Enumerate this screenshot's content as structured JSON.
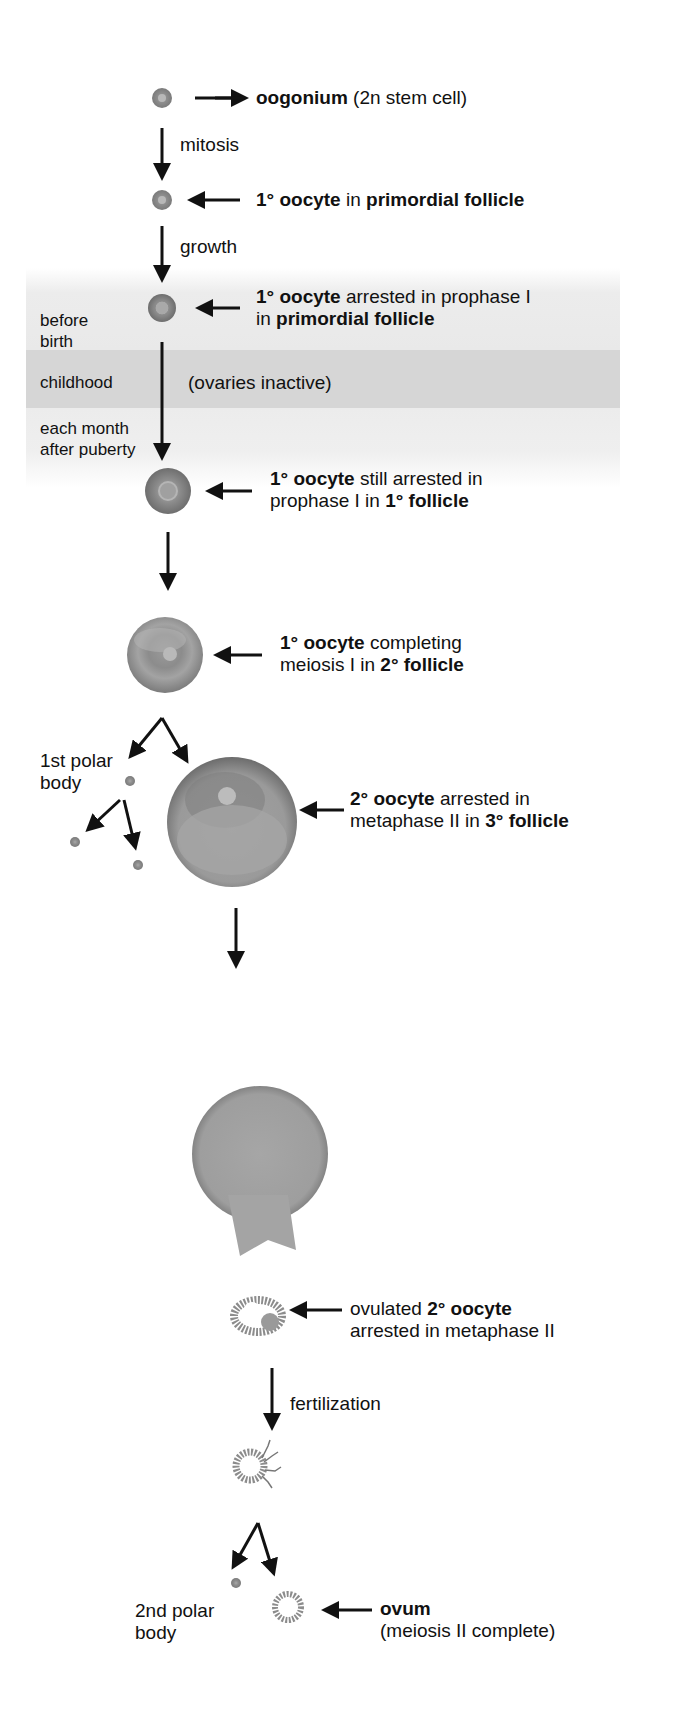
{
  "stages": [
    {
      "id": "oogonium",
      "lines": [
        [
          {
            "t": "oogonium",
            "b": true
          },
          {
            "t": " (2n stem cell)",
            "b": false
          }
        ]
      ]
    },
    {
      "id": "primary-oocyte-primordial",
      "lines": [
        [
          {
            "t": "1° oocyte",
            "b": true
          },
          {
            "t": " in ",
            "b": false
          },
          {
            "t": "primordial follicle",
            "b": true
          }
        ]
      ]
    },
    {
      "id": "primary-oocyte-arrested",
      "lines": [
        [
          {
            "t": "1° oocyte",
            "b": true
          },
          {
            "t": " arrested in prophase I",
            "b": false
          }
        ],
        [
          {
            "t": "in ",
            "b": false
          },
          {
            "t": "primordial follicle",
            "b": true
          }
        ]
      ]
    },
    {
      "id": "primary-oocyte-primary-follicle",
      "lines": [
        [
          {
            "t": "1° oocyte",
            "b": true
          },
          {
            "t": " still arrested in",
            "b": false
          }
        ],
        [
          {
            "t": "prophase I in ",
            "b": false
          },
          {
            "t": "1° follicle",
            "b": true
          }
        ]
      ]
    },
    {
      "id": "primary-oocyte-secondary-follicle",
      "lines": [
        [
          {
            "t": "1° oocyte",
            "b": true
          },
          {
            "t": " completing",
            "b": false
          }
        ],
        [
          {
            "t": "meiosis I in ",
            "b": false
          },
          {
            "t": "2° follicle",
            "b": true
          }
        ]
      ]
    },
    {
      "id": "secondary-oocyte-tertiary-follicle",
      "lines": [
        [
          {
            "t": "2° oocyte",
            "b": true
          },
          {
            "t": " arrested in",
            "b": false
          }
        ],
        [
          {
            "t": "metaphase II in ",
            "b": false
          },
          {
            "t": "3° follicle",
            "b": true
          }
        ]
      ]
    },
    {
      "id": "ovulated-secondary-oocyte",
      "lines": [
        [
          {
            "t": "ovulated ",
            "b": false
          },
          {
            "t": "2° oocyte",
            "b": true
          }
        ],
        [
          {
            "t": "arrested in metaphase II",
            "b": false
          }
        ]
      ]
    },
    {
      "id": "ovum",
      "lines": [
        [
          {
            "t": "ovum",
            "b": true
          }
        ],
        [
          {
            "t": "(meiosis II complete)",
            "b": false
          }
        ]
      ]
    }
  ],
  "process_labels": {
    "mitosis": "mitosis",
    "growth": "growth",
    "fertilization": "fertilization",
    "ovaries_inactive": "(ovaries inactive)"
  },
  "timeline": {
    "before_birth": [
      "before",
      "birth"
    ],
    "childhood": "childhood",
    "each_month": [
      "each month",
      "after puberty"
    ]
  },
  "polar_bodies": {
    "first": [
      "1st polar",
      "body"
    ],
    "second": [
      "2nd polar",
      "body"
    ]
  },
  "colors": {
    "arrow": "#111111",
    "band_light": "#ececec",
    "band_dark": "#d6d6d6",
    "cell_gray": "#8a8a8a"
  }
}
